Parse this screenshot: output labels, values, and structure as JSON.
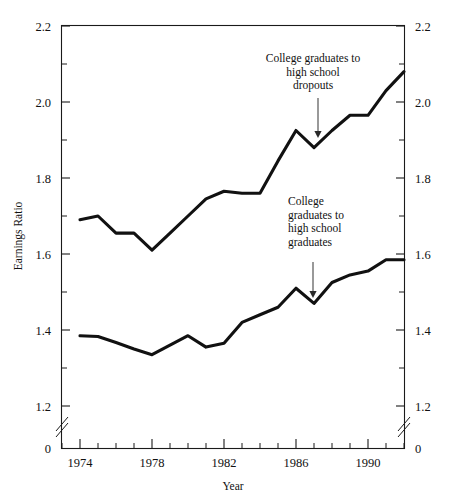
{
  "chart_data": {
    "type": "line",
    "title": "",
    "xlabel": "Year",
    "ylabel": "Earnings Ratio",
    "xlim": [
      1973,
      1992
    ],
    "ylim": [
      1.2,
      2.2
    ],
    "grid": false,
    "legend": "none",
    "y_axis_break_below": 1.2,
    "y_zero_label": "0",
    "x_ticks_major": [
      1974,
      1978,
      1982,
      1986,
      1990
    ],
    "x_tick_labels": [
      "1974",
      "1978",
      "1982",
      "1986",
      "1990"
    ],
    "x_ticks_minor": [
      1973,
      1975,
      1976,
      1977,
      1979,
      1980,
      1981,
      1983,
      1984,
      1985,
      1987,
      1988,
      1989,
      1991,
      1992
    ],
    "y_ticks_major": [
      1.2,
      1.4,
      1.6,
      1.8,
      2.0,
      2.2
    ],
    "y_tick_labels": [
      "1.2",
      "1.4",
      "1.6",
      "1.8",
      "2.0",
      "2.2"
    ],
    "y_ticks_minor": [
      1.3,
      1.5,
      1.7,
      1.9,
      2.1
    ],
    "x": [
      1974,
      1975,
      1976,
      1977,
      1978,
      1979,
      1980,
      1981,
      1982,
      1983,
      1984,
      1985,
      1986,
      1987,
      1988,
      1989,
      1990,
      1991,
      1992
    ],
    "series": [
      {
        "name": "College graduates to high school dropouts",
        "values": [
          1.69,
          1.7,
          1.655,
          1.655,
          1.61,
          1.655,
          1.7,
          1.745,
          1.765,
          1.76,
          1.76,
          1.845,
          1.925,
          1.88,
          1.925,
          1.965,
          1.965,
          2.03,
          2.08
        ]
      },
      {
        "name": "College graduates to high school graduates",
        "values": [
          1.385,
          1.383,
          1.367,
          1.35,
          1.335,
          1.36,
          1.385,
          1.355,
          1.365,
          1.42,
          1.44,
          1.46,
          1.51,
          1.47,
          1.525,
          1.545,
          1.555,
          1.585,
          1.585
        ]
      }
    ],
    "annotations": [
      {
        "id": "upper-annotation",
        "lines": [
          "College graduates to",
          "high school",
          "dropouts"
        ],
        "align": "center",
        "points_to_year": 1987,
        "points_to_value": 1.88
      },
      {
        "id": "lower-annotation",
        "lines": [
          "College",
          "graduates to",
          "high school",
          "graduates"
        ],
        "align": "left",
        "points_to_year": 1987,
        "points_to_value": 1.47
      }
    ]
  },
  "axes": {
    "y_label_left": "Earnings Ratio",
    "x_label": "Year",
    "right_axis_mirrors_left": true
  }
}
